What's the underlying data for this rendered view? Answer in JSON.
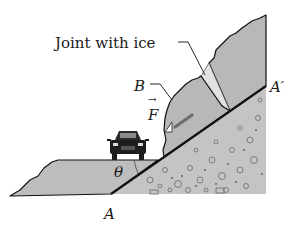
{
  "figure": {
    "type": "physics diagram"
  },
  "labels": {
    "joint": "Joint with ice",
    "point_b": "B",
    "force": "F",
    "force_arrow": "→",
    "angle": "θ",
    "point_a": "A",
    "point_a_prime": "A′"
  },
  "colors": {
    "rock": "#b8b8b8",
    "ground": "#bdbdbd",
    "gravel": "#c4c4c4",
    "ice": "#e2e2e2",
    "force_rod": "#6e6e6e",
    "outline": "#111111",
    "background": "#ffffff"
  },
  "elements": {
    "car": "car-icon",
    "force_rod": "rod"
  }
}
